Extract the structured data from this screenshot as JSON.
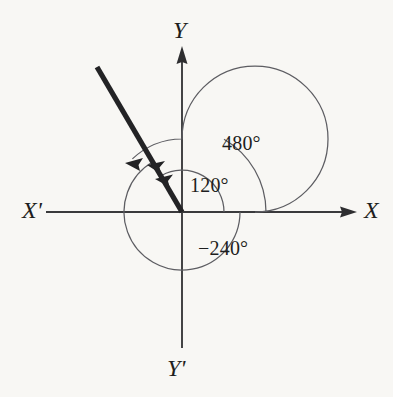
{
  "figure": {
    "kind": "coterminal-angles-diagram",
    "background_color": "#f8f7f4",
    "ink_color": "#232325",
    "origin": {
      "x": 182,
      "y": 212
    },
    "axes": {
      "x_positive_label": "X",
      "x_negative_label": "X'",
      "y_positive_label": "Y",
      "y_negative_label": "Y'"
    },
    "terminal_ray": {
      "angle_degrees": 120,
      "tip": {
        "x": 97,
        "y": 67
      },
      "stroke_width": 5.2
    },
    "angle_labels": {
      "inner": "120°",
      "outer": "480°",
      "negative": "−240°"
    },
    "arcs": [
      {
        "name": "arc-120",
        "label": "120°",
        "radius": 42,
        "sweep_degrees": 120,
        "direction": "counterclockwise"
      },
      {
        "name": "arc-480",
        "label": "480°",
        "radius": 73,
        "sweep_degrees": 480,
        "direction": "counterclockwise"
      },
      {
        "name": "arc-negative-240",
        "label": "−240°",
        "radius": 58,
        "sweep_degrees": -240,
        "direction": "clockwise"
      }
    ]
  }
}
